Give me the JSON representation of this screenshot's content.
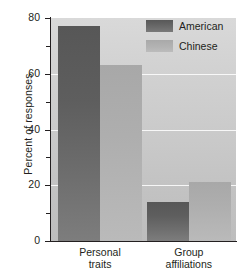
{
  "chart_data": {
    "type": "bar",
    "title": "",
    "xlabel": "",
    "ylabel": "Percent of responses",
    "ylim": [
      0,
      80
    ],
    "grid": true,
    "legend_position": "top-right",
    "categories": [
      "Personal traits",
      "Group affiliations"
    ],
    "category_lines": [
      [
        "Personal",
        "traits"
      ],
      [
        "Group",
        "affiliations"
      ]
    ],
    "series": [
      {
        "name": "American",
        "color": "#5f5f5f",
        "values": [
          77,
          14
        ]
      },
      {
        "name": "Chinese",
        "color": "#b0b0b0",
        "values": [
          63,
          21
        ]
      }
    ],
    "y_ticks_major": [
      0,
      20,
      40,
      60,
      80
    ],
    "y_tick_labels": [
      "0",
      "20",
      "40",
      "60",
      "80"
    ],
    "y_ticks_minor": [
      10,
      30,
      50,
      70
    ],
    "gridline_values": [
      20,
      40,
      60
    ]
  },
  "legend": {
    "items": [
      {
        "label": "American"
      },
      {
        "label": "Chinese"
      }
    ]
  },
  "axes": {
    "y_title": "Percent of responses"
  }
}
